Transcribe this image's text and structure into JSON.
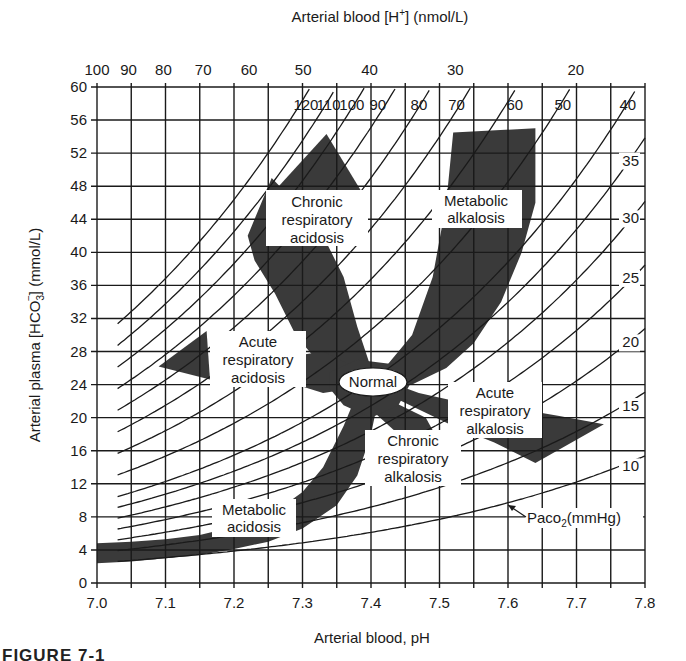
{
  "chart_data": {
    "type": "nomogram",
    "title": "",
    "xlabel": "Arterial blood, pH",
    "ylabel": "Arterial plasma [HCO3-] (mmol/L)",
    "top_xlabel": "Arterial blood [H+] (nmol/L)",
    "xlim": [
      7.0,
      7.8
    ],
    "ylim": [
      0,
      60
    ],
    "grid": true,
    "x_ticks": [
      "7.0",
      "7.1",
      "7.2",
      "7.3",
      "7.4",
      "7.5",
      "7.6",
      "7.7",
      "7.8"
    ],
    "x_minor_step": 0.05,
    "y_ticks": [
      "0",
      "4",
      "8",
      "12",
      "16",
      "20",
      "24",
      "28",
      "32",
      "36",
      "40",
      "44",
      "48",
      "52",
      "56",
      "60"
    ],
    "top_ticks": [
      {
        "label": "100",
        "pH": 7.0
      },
      {
        "label": "90",
        "pH": 7.046
      },
      {
        "label": "80",
        "pH": 7.097
      },
      {
        "label": "70",
        "pH": 7.155
      },
      {
        "label": "60",
        "pH": 7.222
      },
      {
        "label": "50",
        "pH": 7.301
      },
      {
        "label": "40",
        "pH": 7.398
      },
      {
        "label": "30",
        "pH": 7.523
      },
      {
        "label": "20",
        "pH": 7.699
      }
    ],
    "isopleth_label": "PaCO2(mmHg)",
    "isopleths_pco2": [
      10,
      15,
      20,
      25,
      30,
      35,
      40,
      50,
      60,
      70,
      80,
      90,
      100,
      110,
      120
    ],
    "isopleth_labels_top": [
      "120",
      "110",
      "100",
      "90",
      "80",
      "70",
      "60",
      "50",
      "40"
    ],
    "isopleth_labels_right": [
      "35",
      "30",
      "25",
      "20",
      "15",
      "10"
    ],
    "regions": [
      {
        "name": "Normal",
        "label": "Normal",
        "center": [
          7.4,
          24
        ]
      },
      {
        "name": "Acute respiratory acidosis",
        "label": "Acute respiratory acidosis"
      },
      {
        "name": "Chronic respiratory acidosis",
        "label": "Chronic respiratory acidosis"
      },
      {
        "name": "Metabolic alkalosis",
        "label": "Metabolic alkalosis"
      },
      {
        "name": "Acute respiratory alkalosis",
        "label": "Acute respiratory alkalosis"
      },
      {
        "name": "Chronic respiratory alkalosis",
        "label": "Chronic respiratory alkalosis"
      },
      {
        "name": "Metabolic acidosis",
        "label": "Metabolic acidosis"
      }
    ],
    "colors": {
      "band": "#3a3a3a",
      "grid": "#1a1a1a",
      "background": "#ffffff"
    }
  },
  "labels": {
    "top_axis_title": "Arterial blood [H",
    "top_axis_sup": "+",
    "top_axis_tail": "] (nmol/L)",
    "x_axis_title": "Arterial blood, pH",
    "y_axis_title_a": "Arterial plasma [HCO",
    "y_axis_sub": "3",
    "y_axis_sup": "−",
    "y_axis_title_b": "] (mmol/L)",
    "paco2_a": "Paco",
    "paco2_sub": "2",
    "paco2_b": "(mmHg)",
    "normal": "Normal",
    "chronic_resp_acidosis": [
      "Chronic",
      "respiratory",
      "acidosis"
    ],
    "metabolic_alkalosis": [
      "Metabolic",
      "alkalosis"
    ],
    "acute_resp_acidosis": [
      "Acute",
      "respiratory",
      "acidosis"
    ],
    "acute_resp_alkalosis": [
      "Acute",
      "respiratory",
      "alkalosis"
    ],
    "chronic_resp_alkalosis": [
      "Chronic",
      "respiratory",
      "alkalosis"
    ],
    "metabolic_acidosis": [
      "Metabolic",
      "acidosis"
    ],
    "caption": "FIGURE 7-1"
  }
}
